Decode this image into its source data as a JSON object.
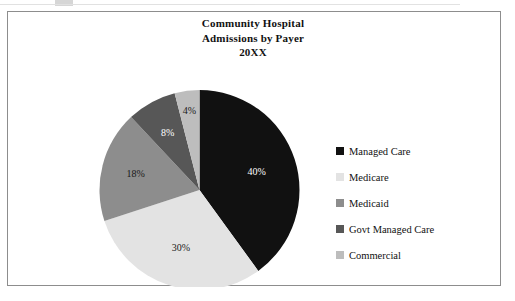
{
  "figure": {
    "title_lines": [
      "Community Hospital",
      "Admissions by Payer",
      "20XX"
    ],
    "border_color": "#8d8d8d",
    "background": "#ffffff"
  },
  "legend": {
    "entries": [
      {
        "label": "Managed Care",
        "color": "#111111"
      },
      {
        "label": "Medicare",
        "color": "#e3e3e3"
      },
      {
        "label": "Medicaid",
        "color": "#8d8d8d"
      },
      {
        "label": "Govt Managed Care",
        "color": "#575757"
      },
      {
        "label": "Commercial",
        "color": "#bdbdbd"
      }
    ]
  },
  "chart_data": {
    "type": "pie",
    "title": "Community Hospital Admissions by Payer 20XX",
    "categories": [
      "Managed Care",
      "Medicare",
      "Medicaid",
      "Govt Managed Care",
      "Commercial"
    ],
    "values": [
      40,
      30,
      18,
      8,
      4
    ],
    "value_unit": "%",
    "data_labels": [
      "40%",
      "30%",
      "18%",
      "8%",
      "4%"
    ],
    "colors": [
      "#111111",
      "#e3e3e3",
      "#8d8d8d",
      "#575757",
      "#bdbdbd"
    ],
    "label_text_colors": [
      "#ffffff",
      "#1a1a1a",
      "#1a1a1a",
      "#ffffff",
      "#1a1a1a"
    ],
    "start_angle_deg": 0,
    "direction": "clockwise",
    "legend_position": "right",
    "grid": false,
    "total": 100
  }
}
